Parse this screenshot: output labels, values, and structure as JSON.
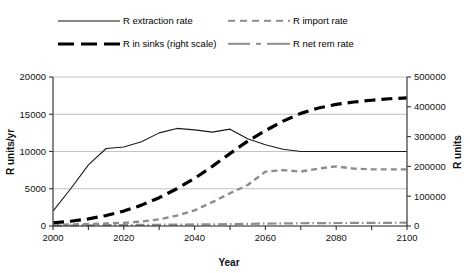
{
  "chart_data": {
    "type": "line",
    "title": "",
    "xlabel": "Year",
    "ylabel": "R units/yr",
    "y2label": "R units",
    "xlim": [
      2000,
      2100
    ],
    "ylim": [
      0,
      20000
    ],
    "y2lim": [
      0,
      500000
    ],
    "grid": true,
    "legend_position": "top",
    "xticks": [
      2000,
      2010,
      2020,
      2030,
      2040,
      2050,
      2060,
      2070,
      2080,
      2090,
      2100
    ],
    "xticklabels": [
      "2000",
      "",
      "2020",
      "",
      "2040",
      "",
      "2060",
      "",
      "2080",
      "",
      "2100"
    ],
    "yticks": [
      0,
      5000,
      10000,
      15000,
      20000
    ],
    "yticklabels": [
      "0",
      "5000",
      "10000",
      "15000",
      "20000"
    ],
    "y2ticks": [
      0,
      100000,
      200000,
      300000,
      400000,
      500000
    ],
    "y2ticklabels": [
      "0",
      "100000",
      "200000",
      "300000",
      "400000",
      "500000"
    ],
    "x": [
      2000,
      2005,
      2010,
      2015,
      2020,
      2025,
      2030,
      2035,
      2040,
      2045,
      2050,
      2055,
      2060,
      2065,
      2070,
      2075,
      2080,
      2085,
      2090,
      2095,
      2100
    ],
    "series": [
      {
        "name": "R extraction rate",
        "axis": "left",
        "style": "solid",
        "color": "#1a1a1a",
        "values": [
          2000,
          5000,
          8200,
          10400,
          10600,
          11300,
          12500,
          13100,
          12900,
          12600,
          13000,
          11700,
          10900,
          10300,
          10000,
          10000,
          10000,
          10000,
          10000,
          10000,
          10000
        ]
      },
      {
        "name": "R import rate",
        "axis": "left",
        "style": "dashed",
        "color": "#8d8d8d",
        "values": [
          150,
          200,
          260,
          330,
          420,
          600,
          900,
          1400,
          2100,
          3200,
          4400,
          5500,
          7300,
          7500,
          7300,
          7700,
          8000,
          7700,
          7600,
          7600,
          7600
        ]
      },
      {
        "name": "R in sinks (right scale)",
        "axis": "right",
        "style": "thick-dashed",
        "color": "#000000",
        "values": [
          11000,
          16000,
          24000,
          35000,
          50000,
          70000,
          95000,
          125000,
          160000,
          200000,
          243000,
          285000,
          320000,
          352000,
          378000,
          396000,
          408000,
          416000,
          422000,
          427000,
          430000
        ]
      },
      {
        "name": "R net rem rate",
        "axis": "left",
        "style": "dash-dot",
        "color": "#8d8d8d",
        "values": [
          60,
          70,
          90,
          110,
          130,
          150,
          170,
          190,
          210,
          230,
          250,
          280,
          320,
          350,
          370,
          390,
          400,
          410,
          420,
          430,
          440
        ]
      }
    ]
  },
  "legend": {
    "items": [
      {
        "label": "R extraction rate",
        "icon": "solid-line-icon"
      },
      {
        "label": "R in sinks (right scale)",
        "icon": "thick-dashed-line-icon"
      },
      {
        "label": "R import rate",
        "icon": "gray-dashed-line-icon"
      },
      {
        "label": "R net rem rate",
        "icon": "gray-dash-dot-line-icon"
      }
    ]
  }
}
